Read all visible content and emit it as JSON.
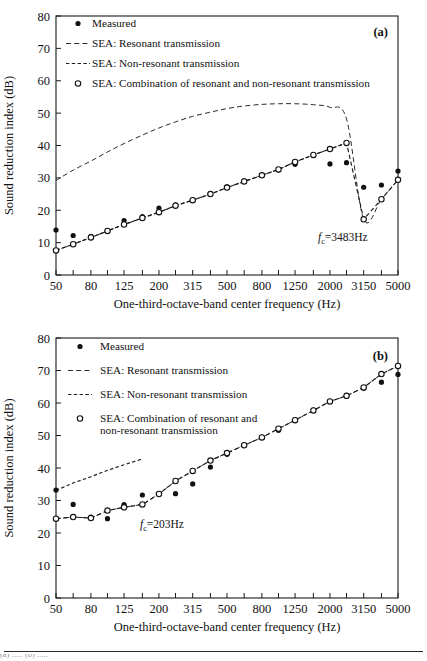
{
  "figure": {
    "panels": [
      "a",
      "b"
    ],
    "separator_visible": true,
    "caption_fragment": "(a) ..... (b) ....."
  },
  "panel_a": {
    "tag": "(a)",
    "annotation": {
      "prefix": "f",
      "subscript": "c",
      "value": "=3483Hz"
    },
    "legend": [
      {
        "marker": "filled-circle",
        "label": "Measured"
      },
      {
        "marker": "dashed-line-long",
        "label": "SEA: Resonant transmission"
      },
      {
        "marker": "dashed-line-short",
        "label": "SEA: Non-resonant transmission"
      },
      {
        "marker": "open-circle",
        "label": "SEA: Combination of resonant and non-resonant transmission"
      }
    ],
    "chart_data": {
      "type": "line",
      "title": "",
      "xlabel": "One-third-octave-band center frequency (Hz)",
      "ylabel": "Sound reduction index (dB)",
      "xscale": "log",
      "xlim": [
        50,
        5000
      ],
      "ylim": [
        0,
        80
      ],
      "yticks": [
        0,
        10,
        20,
        30,
        40,
        50,
        60,
        70,
        80
      ],
      "xticks": [
        50,
        63,
        80,
        100,
        125,
        160,
        200,
        250,
        315,
        400,
        500,
        630,
        800,
        1000,
        1250,
        1600,
        2000,
        2500,
        3150,
        4000,
        5000
      ],
      "xticklabels": [
        "50",
        "",
        "80",
        "",
        "125",
        "",
        "200",
        "",
        "315",
        "",
        "500",
        "",
        "800",
        "",
        "1250",
        "",
        "2000",
        "",
        "3150",
        "",
        "5000"
      ],
      "grid": false,
      "legend_position": "upper-left",
      "x": [
        50,
        63,
        80,
        100,
        125,
        160,
        200,
        250,
        315,
        400,
        500,
        630,
        800,
        1000,
        1250,
        1600,
        2000,
        2500,
        3150,
        4000,
        5000
      ],
      "series": [
        {
          "name": "Measured",
          "style": "filled-circle-markers",
          "values": [
            13.9,
            12.2,
            11.9,
            13.7,
            16.8,
            18.0,
            20.7,
            21.7,
            23.2,
            25.1,
            27.2,
            29.1,
            30.8,
            32.5,
            34.2,
            37.0,
            34.3,
            34.7,
            27.1,
            27.8,
            32.1
          ]
        },
        {
          "name": "SEA: Resonant transmission",
          "style": "long-dashed-line",
          "values": [
            29.2,
            32.4,
            35.2,
            38.0,
            40.6,
            43.2,
            45.4,
            47.3,
            49.0,
            50.3,
            51.4,
            52.2,
            52.7,
            52.9,
            52.9,
            52.6,
            51.8,
            48.2,
            17.2,
            23.4,
            29.4
          ]
        },
        {
          "name": "SEA: Non-resonant transmission",
          "style": "short-dashed-line",
          "values": [
            7.6,
            9.5,
            11.6,
            13.6,
            15.6,
            17.6,
            19.4,
            21.4,
            23.1,
            25.0,
            27.0,
            28.9,
            30.8,
            32.6,
            34.9,
            37.1,
            38.9,
            40.8,
            null,
            null,
            null
          ]
        },
        {
          "name": "SEA: Combination of resonant and non-resonant transmission",
          "style": "open-circle-markers-dashed",
          "values": [
            7.6,
            9.5,
            11.6,
            13.6,
            15.6,
            17.6,
            19.4,
            21.4,
            23.1,
            25.0,
            27.0,
            28.9,
            30.8,
            32.6,
            34.9,
            37.1,
            38.9,
            40.8,
            17.2,
            23.4,
            29.4
          ]
        }
      ]
    }
  },
  "panel_b": {
    "tag": "(b)",
    "annotation": {
      "prefix": "f",
      "subscript": "c",
      "value": "=203Hz"
    },
    "legend": [
      {
        "marker": "filled-circle",
        "label": "Measured"
      },
      {
        "marker": "dashed-line-long",
        "label": "SEA: Resonant transmission"
      },
      {
        "marker": "dashed-line-short",
        "label": "SEA: Non-resonant transmission"
      },
      {
        "marker": "open-circle",
        "label": "SEA: Combination of resonant and",
        "label2": "non-resonant transmission"
      }
    ],
    "chart_data": {
      "type": "line",
      "title": "",
      "xlabel": "One-third-octave-band center frequency (Hz)",
      "ylabel": "Sound reduction index (dB)",
      "xscale": "log",
      "xlim": [
        50,
        5000
      ],
      "ylim": [
        0,
        80
      ],
      "yticks": [
        0,
        10,
        20,
        30,
        40,
        50,
        60,
        70,
        80
      ],
      "xticks": [
        50,
        63,
        80,
        100,
        125,
        160,
        200,
        250,
        315,
        400,
        500,
        630,
        800,
        1000,
        1250,
        1600,
        2000,
        2500,
        3150,
        4000,
        5000
      ],
      "xticklabels": [
        "50",
        "",
        "80",
        "",
        "125",
        "",
        "200",
        "",
        "315",
        "",
        "500",
        "",
        "800",
        "",
        "1250",
        "",
        "2000",
        "",
        "3150",
        "",
        "5000"
      ],
      "grid": false,
      "legend_position": "upper-left",
      "x": [
        50,
        63,
        80,
        100,
        125,
        160,
        200,
        250,
        315,
        400,
        500,
        630,
        800,
        1000,
        1250,
        1600,
        2000,
        2500,
        3150,
        4000,
        5000
      ],
      "series": [
        {
          "name": "Measured",
          "style": "filled-circle-markers",
          "values": [
            33.2,
            28.8,
            24.9,
            24.4,
            28.7,
            31.7,
            32.1,
            32.1,
            35.1,
            40.3,
            44.2,
            47.0,
            49.4,
            51.6,
            54.7,
            57.8,
            60.5,
            62.1,
            64.6,
            66.4,
            68.8
          ]
        },
        {
          "name": "SEA: Resonant transmission",
          "style": "long-dashed-line",
          "values": [
            24.4,
            24.9,
            24.6,
            26.9,
            27.9,
            28.8,
            32.0,
            36.0,
            39.1,
            42.3,
            44.6,
            47.0,
            49.4,
            52.1,
            54.7,
            57.7,
            60.5,
            62.2,
            64.8,
            68.9,
            71.4
          ]
        },
        {
          "name": "SEA: Non-resonant transmission",
          "style": "short-dashed-line",
          "values": [
            33.1,
            35.4,
            37.3,
            39.3,
            41.0,
            42.8,
            null,
            null,
            null,
            null,
            null,
            null,
            null,
            null,
            null,
            null,
            null,
            null,
            null,
            null,
            null
          ]
        },
        {
          "name": "SEA: Combination of resonant and non-resonant transmission",
          "style": "open-circle-markers-dashed",
          "values": [
            24.4,
            24.9,
            24.6,
            26.9,
            27.9,
            28.8,
            32.0,
            36.0,
            39.1,
            42.3,
            44.6,
            47.0,
            49.4,
            52.1,
            54.7,
            57.7,
            60.5,
            62.2,
            64.8,
            68.9,
            71.4
          ]
        }
      ]
    }
  }
}
